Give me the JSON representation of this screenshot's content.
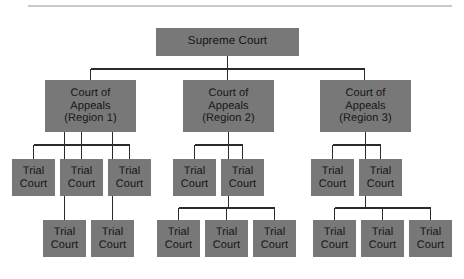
{
  "diagram": {
    "title_text": "",
    "style": {
      "box_fill": "#787878",
      "box_text": "#141414",
      "connector_color": "#2b2b2b",
      "rule_color": "#b9b9b9",
      "background": "#ffffff"
    },
    "top_rule": {
      "present": true,
      "x1": 28,
      "x2": 452,
      "y": 6
    },
    "nodes": [
      {
        "id": "supreme",
        "lines": [
          "Supreme Court"
        ],
        "x": 156,
        "y": 28,
        "w": 143,
        "h": 28,
        "level": 0
      },
      {
        "id": "coa1",
        "lines": [
          "Court of",
          "Appeals",
          "(Region 1)"
        ],
        "x": 45,
        "y": 80,
        "w": 91,
        "h": 52,
        "level": 1
      },
      {
        "id": "coa2",
        "lines": [
          "Court of",
          "Appeals",
          "(Region 2)"
        ],
        "x": 183,
        "y": 80,
        "w": 91,
        "h": 52,
        "level": 1
      },
      {
        "id": "coa3",
        "lines": [
          "Court of",
          "Appeals",
          "(Region 3)"
        ],
        "x": 320,
        "y": 80,
        "w": 91,
        "h": 52,
        "level": 1
      },
      {
        "id": "r1t1",
        "lines": [
          "Trial",
          "Court"
        ],
        "x": 12,
        "y": 159,
        "w": 43,
        "h": 37,
        "level": 2
      },
      {
        "id": "r1t2",
        "lines": [
          "Trial",
          "Court"
        ],
        "x": 60,
        "y": 159,
        "w": 43,
        "h": 37,
        "level": 2
      },
      {
        "id": "r1t3",
        "lines": [
          "Trial",
          "Court"
        ],
        "x": 108,
        "y": 159,
        "w": 43,
        "h": 37,
        "level": 2
      },
      {
        "id": "r1b1",
        "lines": [
          "Trial",
          "Court"
        ],
        "x": 43,
        "y": 220,
        "w": 43,
        "h": 37,
        "level": 3
      },
      {
        "id": "r1b2",
        "lines": [
          "Trial",
          "Court"
        ],
        "x": 91,
        "y": 220,
        "w": 43,
        "h": 37,
        "level": 3
      },
      {
        "id": "r2t1",
        "lines": [
          "Trial",
          "Court"
        ],
        "x": 173,
        "y": 159,
        "w": 43,
        "h": 37,
        "level": 2
      },
      {
        "id": "r2t2",
        "lines": [
          "Trial",
          "Court"
        ],
        "x": 221,
        "y": 159,
        "w": 43,
        "h": 37,
        "level": 2
      },
      {
        "id": "r2b1",
        "lines": [
          "Trial",
          "Court"
        ],
        "x": 157,
        "y": 220,
        "w": 43,
        "h": 37,
        "level": 3
      },
      {
        "id": "r2b2",
        "lines": [
          "Trial",
          "Court"
        ],
        "x": 205,
        "y": 220,
        "w": 43,
        "h": 37,
        "level": 3
      },
      {
        "id": "r2b3",
        "lines": [
          "Trial",
          "Court"
        ],
        "x": 253,
        "y": 220,
        "w": 43,
        "h": 37,
        "level": 3
      },
      {
        "id": "r3t1",
        "lines": [
          "Trial",
          "Court"
        ],
        "x": 311,
        "y": 159,
        "w": 43,
        "h": 37,
        "level": 2
      },
      {
        "id": "r3t2",
        "lines": [
          "Trial",
          "Court"
        ],
        "x": 359,
        "y": 159,
        "w": 43,
        "h": 37,
        "level": 2
      },
      {
        "id": "r3b1",
        "lines": [
          "Trial",
          "Court"
        ],
        "x": 313,
        "y": 220,
        "w": 43,
        "h": 37,
        "level": 3
      },
      {
        "id": "r3b2",
        "lines": [
          "Trial",
          "Court"
        ],
        "x": 361,
        "y": 220,
        "w": 43,
        "h": 37,
        "level": 3
      },
      {
        "id": "r3b3",
        "lines": [
          "Trial",
          "Court"
        ],
        "x": 409,
        "y": 220,
        "w": 43,
        "h": 37,
        "level": 3
      }
    ],
    "edges": [
      {
        "from": "supreme",
        "to": "coa1"
      },
      {
        "from": "supreme",
        "to": "coa2"
      },
      {
        "from": "supreme",
        "to": "coa3"
      },
      {
        "from": "coa1",
        "to": "r1t1"
      },
      {
        "from": "coa1",
        "to": "r1t2"
      },
      {
        "from": "coa1",
        "to": "r1t3"
      },
      {
        "from": "coa1",
        "to": "r1b1"
      },
      {
        "from": "coa1",
        "to": "r1b2"
      },
      {
        "from": "coa2",
        "to": "r2t1"
      },
      {
        "from": "coa2",
        "to": "r2t2"
      },
      {
        "from": "coa2",
        "to": "r2b1"
      },
      {
        "from": "coa2",
        "to": "r2b2"
      },
      {
        "from": "coa2",
        "to": "r2b3"
      },
      {
        "from": "coa3",
        "to": "r3t1"
      },
      {
        "from": "coa3",
        "to": "r3t2"
      },
      {
        "from": "coa3",
        "to": "r3b1"
      },
      {
        "from": "coa3",
        "to": "r3b2"
      },
      {
        "from": "coa3",
        "to": "r3b3"
      }
    ],
    "connector_paths": [
      "M227.5,56 L227.5,69",
      "M90.5,69 L364.5,69",
      "M90.5,69 L90.5,80",
      "M227.5,69 L227.5,80",
      "M364.5,69 L364.5,80",
      "M33.5,145 L129.5,145",
      "M33.5,145 L33.5,159",
      "M81.5,132 L81.5,159",
      "M129.5,145 L129.5,159",
      "M64.5,132 L64.5,220",
      "M112.5,132 L112.5,220",
      "M228.5,132 L228.5,208",
      "M194.5,145 L242.5,145",
      "M194.5,145 L194.5,159",
      "M242.5,145 L242.5,159",
      "M178.5,208 L274.5,208",
      "M178.5,208 L178.5,220",
      "M226.5,208 L226.5,220",
      "M274.5,208 L274.5,220",
      "M365.5,132 L365.5,208",
      "M332.5,145 L380.5,145",
      "M332.5,145 L332.5,159",
      "M380.5,145 L380.5,159",
      "M334.5,208 L430.5,208",
      "M334.5,208 L334.5,220",
      "M382.5,208 L382.5,220",
      "M430.5,208 L430.5,220"
    ]
  }
}
